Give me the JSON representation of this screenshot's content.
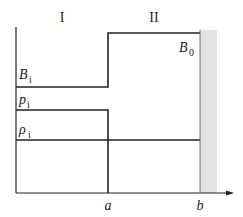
{
  "regions": {
    "region_1": "I",
    "region_2": "II"
  },
  "labels": {
    "B0": {
      "base": "B",
      "sub": "0"
    },
    "Bi": {
      "base": "B",
      "sub": "i"
    },
    "pi": {
      "base": "p",
      "sub": "i"
    },
    "rhoi": {
      "base": "ρ",
      "sub": "i"
    }
  },
  "axis": {
    "a": "a",
    "b": "b"
  },
  "colors": {
    "line": "#222222",
    "wall": "#e2e2e2"
  }
}
